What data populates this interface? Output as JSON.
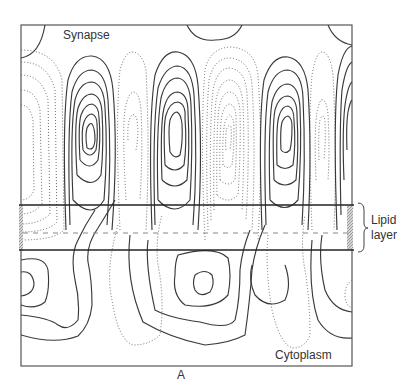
{
  "figure": {
    "panel_label": "A",
    "top_region_label": "Synapse",
    "bottom_region_label": "Cytoplasm",
    "bracket_label_line1": "Lipid",
    "bracket_label_line2": "layer"
  },
  "legend_semantics": {
    "solid_contours": "positive potential",
    "dotted_contours": "negative potential",
    "dashed_line": "membrane midplane",
    "hatched_bars": "membrane edges"
  },
  "colors": {
    "background": "#ffffff",
    "line": "#3a3a3a",
    "dotted": "#6a6a6a",
    "hatch": "#bbbbbb"
  }
}
